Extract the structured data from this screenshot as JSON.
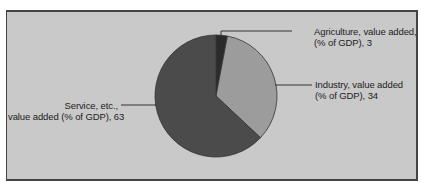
{
  "chart_data": {
    "type": "pie",
    "title": "",
    "start_angle": "12 o'clock, clockwise",
    "slices": [
      {
        "label": "Agriculture, value added, (% of GDP)",
        "display_label_line1": "Agriculture, value added,",
        "display_label_line2": "(% of GDP), 3",
        "value": 3,
        "color": "#2b2b2b"
      },
      {
        "label": "Industry, value added (% of GDP)",
        "display_label_line1": "Industry, value added",
        "display_label_line2": "(% of GDP), 34",
        "value": 34,
        "color": "#9c9c9c"
      },
      {
        "label": "Service, etc., value added (% of GDP)",
        "display_label_line1": "Service, etc.,",
        "display_label_line2": "value added (% of GDP), 63",
        "value": 63,
        "color": "#4b4b4b"
      }
    ],
    "legend": "none (leader-line labels)",
    "background": "#c9c9c9"
  }
}
